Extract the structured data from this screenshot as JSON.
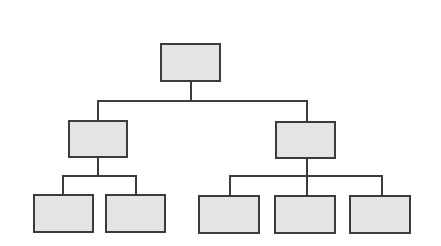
{
  "diagram": {
    "type": "org-chart",
    "colors": {
      "node_fill": "#e4e4e4",
      "node_border": "#3c3c3c",
      "connector": "#3c3c3c",
      "background": "#ffffff"
    },
    "nodes": [
      {
        "id": "root",
        "label": "",
        "level": 0,
        "x": 160,
        "y": 43,
        "w": 61,
        "h": 39
      },
      {
        "id": "mid-left",
        "label": "",
        "level": 1,
        "parent": "root",
        "x": 68,
        "y": 120,
        "w": 60,
        "h": 38
      },
      {
        "id": "mid-right",
        "label": "",
        "level": 1,
        "parent": "root",
        "x": 275,
        "y": 121,
        "w": 61,
        "h": 38
      },
      {
        "id": "leaf-1",
        "label": "",
        "level": 2,
        "parent": "mid-left",
        "x": 33,
        "y": 194,
        "w": 61,
        "h": 39
      },
      {
        "id": "leaf-2",
        "label": "",
        "level": 2,
        "parent": "mid-left",
        "x": 105,
        "y": 194,
        "w": 61,
        "h": 39
      },
      {
        "id": "leaf-3",
        "label": "",
        "level": 2,
        "parent": "mid-right",
        "x": 198,
        "y": 195,
        "w": 62,
        "h": 39
      },
      {
        "id": "leaf-4",
        "label": "",
        "level": 2,
        "parent": "mid-right",
        "x": 274,
        "y": 195,
        "w": 62,
        "h": 39
      },
      {
        "id": "leaf-5",
        "label": "",
        "level": 2,
        "parent": "mid-right",
        "x": 349,
        "y": 195,
        "w": 62,
        "h": 39
      }
    ],
    "connectors": [
      {
        "id": "root-down",
        "x": 190,
        "y": 82,
        "w": 2,
        "h": 20
      },
      {
        "id": "level1-bus",
        "x": 97,
        "y": 100,
        "w": 211,
        "h": 2
      },
      {
        "id": "bus-to-mid-left",
        "x": 97,
        "y": 100,
        "w": 2,
        "h": 20
      },
      {
        "id": "bus-to-mid-right",
        "x": 306,
        "y": 100,
        "w": 2,
        "h": 21
      },
      {
        "id": "mid-left-down",
        "x": 97,
        "y": 158,
        "w": 2,
        "h": 18
      },
      {
        "id": "left-bus",
        "x": 62,
        "y": 175,
        "w": 75,
        "h": 2
      },
      {
        "id": "left-bus-to-leaf-1",
        "x": 62,
        "y": 175,
        "w": 2,
        "h": 19
      },
      {
        "id": "left-bus-to-leaf-2",
        "x": 135,
        "y": 175,
        "w": 2,
        "h": 19
      },
      {
        "id": "mid-right-down",
        "x": 306,
        "y": 159,
        "w": 2,
        "h": 17
      },
      {
        "id": "right-bus",
        "x": 229,
        "y": 175,
        "w": 154,
        "h": 2
      },
      {
        "id": "right-bus-to-leaf-3",
        "x": 229,
        "y": 175,
        "w": 2,
        "h": 20
      },
      {
        "id": "right-bus-to-leaf-4",
        "x": 306,
        "y": 175,
        "w": 2,
        "h": 20
      },
      {
        "id": "right-bus-to-leaf-5",
        "x": 381,
        "y": 175,
        "w": 2,
        "h": 20
      }
    ]
  }
}
